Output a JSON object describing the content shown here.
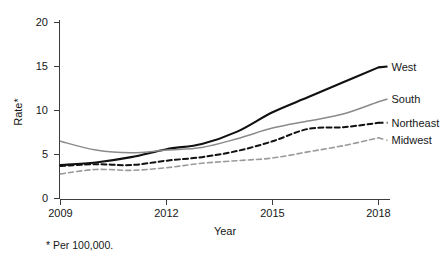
{
  "chart_data": {
    "type": "line",
    "title": "",
    "xlabel": "Year",
    "ylabel": "Rate*",
    "footnote": "* Per 100,000.",
    "xlim": [
      2009,
      2018
    ],
    "ylim": [
      0,
      20
    ],
    "grid": false,
    "legend_position": "right-inline-labels",
    "x": [
      2009,
      2010,
      2011,
      2012,
      2013,
      2014,
      2015,
      2016,
      2017,
      2018
    ],
    "xticks": [
      "2009",
      "2012",
      "2015",
      "2018"
    ],
    "xtick_values": [
      2009,
      2012,
      2015,
      2018
    ],
    "yticks": [
      "0",
      "5",
      "10",
      "15",
      "20"
    ],
    "ytick_values": [
      0,
      5,
      10,
      15,
      20
    ],
    "series": [
      {
        "name": "West",
        "values": [
          3.8,
          4.1,
          4.7,
          5.6,
          6.2,
          7.6,
          9.8,
          11.5,
          13.2,
          14.9
        ],
        "color": "#111111",
        "style": "solid",
        "width": 2.1,
        "label_y": 15.0
      },
      {
        "name": "South",
        "values": [
          6.5,
          5.5,
          5.2,
          5.5,
          5.8,
          6.8,
          8.0,
          8.8,
          9.6,
          11.0
        ],
        "color": "#8a8a8a",
        "style": "solid",
        "width": 1.5,
        "label_y": 11.3
      },
      {
        "name": "Northeast",
        "values": [
          3.7,
          3.9,
          3.8,
          4.3,
          4.7,
          5.4,
          6.5,
          7.9,
          8.1,
          8.6
        ],
        "color": "#111111",
        "style": "dashed",
        "width": 2.0,
        "label_y": 8.6
      },
      {
        "name": "Midwest",
        "values": [
          2.8,
          3.3,
          3.2,
          3.5,
          4.0,
          4.3,
          4.6,
          5.3,
          6.0,
          6.9
        ],
        "color": "#9a9a9a",
        "style": "dashed",
        "width": 1.6,
        "label_y": 6.6
      }
    ]
  }
}
